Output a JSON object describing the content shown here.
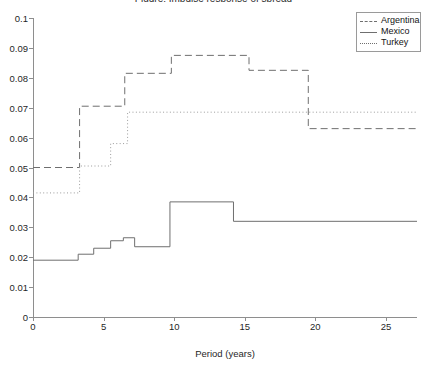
{
  "chart_data": {
    "type": "line",
    "title": "Figure: Impulse response of spread",
    "xlabel": "Period (years)",
    "ylabel": "",
    "xlim": [
      0,
      27.2
    ],
    "ylim": [
      0,
      0.1
    ],
    "grid": false,
    "legend_position": "top-right",
    "step_style": "post",
    "xticks": [
      "0",
      "5",
      "10",
      "15",
      "20",
      "25"
    ],
    "xtick_values": [
      0,
      5,
      10,
      15,
      20,
      25
    ],
    "yticks": [
      "0",
      "0.01",
      "0.02",
      "0.03",
      "0.04",
      "0.05",
      "0.06",
      "0.07",
      "0.08",
      "0.09",
      "0.1"
    ],
    "ytick_values": [
      0,
      0.01,
      0.02,
      0.03,
      0.04,
      0.05,
      0.06,
      0.07,
      0.08,
      0.09,
      0.1
    ],
    "series": [
      {
        "name": "Argentina",
        "style": "dashed",
        "color": "#6f6f6f",
        "x": [
          0,
          3.3,
          6.5,
          9.8,
          15.3,
          19.5,
          27.2
        ],
        "values": [
          0.05,
          0.0705,
          0.0815,
          0.0875,
          0.0825,
          0.063,
          0.063
        ]
      },
      {
        "name": "Mexico",
        "style": "solid",
        "color": "#6f6f6f",
        "x": [
          0,
          3.2,
          4.3,
          5.5,
          6.4,
          7.2,
          9.7,
          14.2,
          27.2
        ],
        "values": [
          0.019,
          0.021,
          0.023,
          0.0255,
          0.0265,
          0.0235,
          0.0385,
          0.032,
          0.032
        ]
      },
      {
        "name": "Turkey",
        "style": "dotted",
        "color": "#9b9b9b",
        "x": [
          0,
          3.3,
          5.5,
          6.7,
          27.2
        ],
        "values": [
          0.0415,
          0.0505,
          0.058,
          0.0685,
          0.0685
        ]
      }
    ]
  },
  "legend": {
    "items": [
      {
        "label": "Argentina",
        "style": "dashed"
      },
      {
        "label": "Mexico",
        "style": "solid"
      },
      {
        "label": "Turkey",
        "style": "dotted"
      }
    ]
  }
}
